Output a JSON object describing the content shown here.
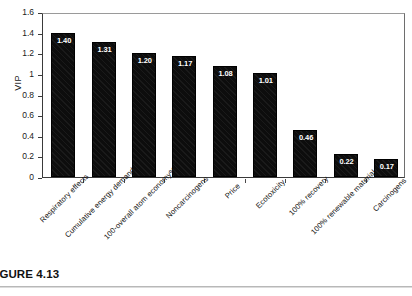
{
  "caption": {
    "text": "FIGURE 4.13"
  },
  "chart_data": {
    "type": "bar",
    "title": "",
    "xlabel": "",
    "ylabel": "VIP",
    "ylim": [
      0,
      1.6
    ],
    "ytick_step": 0.2,
    "ytick_labels": [
      "1.6",
      "1.4",
      "1.2",
      "1",
      "0.8",
      "0.6",
      "0.4",
      "0.2",
      "0"
    ],
    "ytick_values": [
      1.6,
      1.4,
      1.2,
      1.0,
      0.8,
      0.6,
      0.4,
      0.2,
      0
    ],
    "grid": false,
    "legend": "none",
    "bar_color": "#0d0d0d",
    "label_color": "#ffffff",
    "categories": [
      "Respiratory effects",
      "Cumulative energy demand",
      "100-overall atom economy%",
      "Noncarcinogens",
      "Price",
      "Ecotoxicity",
      "100% recovery",
      "100% renewable material",
      "Carcinogens"
    ],
    "values": [
      1.4,
      1.31,
      1.2,
      1.17,
      1.08,
      1.01,
      0.46,
      0.22,
      0.17
    ],
    "data_labels": [
      "1.40",
      "1.31",
      "1.20",
      "1.17",
      "1.08",
      "1.01",
      "0.46",
      "0.22",
      "0.17"
    ]
  }
}
